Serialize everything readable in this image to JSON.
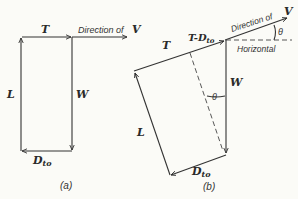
{
  "figure_a": {
    "caption": "(a)",
    "labels": {
      "thrust": "T",
      "direction": "Direction of",
      "velocity": "V",
      "lift": "L",
      "weight": "W",
      "drag_main": "D",
      "drag_sub": "to"
    }
  },
  "figure_b": {
    "caption": "(b)",
    "labels": {
      "thrust": "T",
      "net_thrust_main": "T-D",
      "net_thrust_sub": "to",
      "direction": "Direction of",
      "velocity": "V",
      "horizontal": "Horizontal",
      "angle_top": "θ",
      "angle_mid": "θ",
      "lift": "L",
      "weight": "W",
      "drag_main": "D",
      "drag_sub": "to"
    }
  }
}
